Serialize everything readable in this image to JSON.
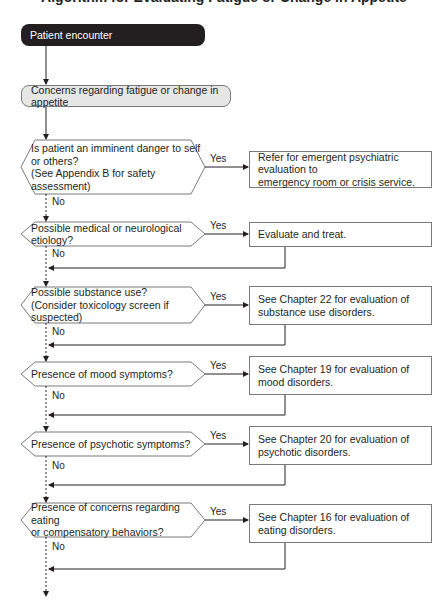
{
  "title": "Algorithm for Evaluating Fatigue or Change in Appetite",
  "start": {
    "label": "Patient encounter"
  },
  "concern": {
    "label": "Concerns regarding fatigue or change in appetite"
  },
  "labels": {
    "yes": "Yes",
    "no": "No"
  },
  "decisions": [
    {
      "lines": [
        "Is patient an imminent danger to self",
        "or others?",
        "(See Appendix B for safety assessment)"
      ],
      "action": [
        "Refer for emergent psychiatric evaluation to",
        "emergency room or crisis service."
      ]
    },
    {
      "lines": [
        "Possible medical or neurological etiology?"
      ],
      "action": [
        "Evaluate and treat."
      ]
    },
    {
      "lines": [
        "Possible substance use?",
        "(Consider toxicology screen if suspected)"
      ],
      "action": [
        "See Chapter 22 for evaluation of",
        "substance use disorders."
      ]
    },
    {
      "lines": [
        "Presence of mood symptoms?"
      ],
      "action": [
        "See Chapter 19 for evaluation of",
        "mood disorders."
      ]
    },
    {
      "lines": [
        "Presence of psychotic symptoms?"
      ],
      "action": [
        "See Chapter 20 for evaluation of",
        "psychotic disorders."
      ]
    },
    {
      "lines": [
        "Presence of concerns regarding eating",
        "or compensatory behaviors?"
      ],
      "action": [
        "See Chapter 16 for evaluation of",
        "eating disorders."
      ]
    }
  ],
  "colors": {
    "start_fill": "#231f20",
    "concern_fill": "#e6e6e6",
    "stroke": "#231f20",
    "box_border": "#7a7a7a"
  }
}
